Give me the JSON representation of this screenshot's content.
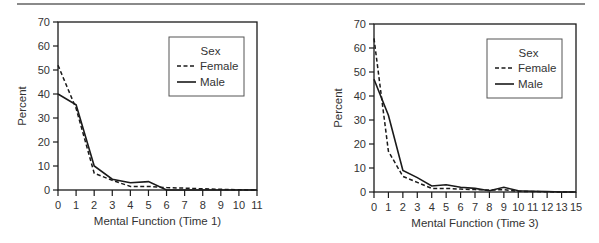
{
  "chart_data": [
    {
      "type": "line",
      "title": "",
      "xlabel": "Mental Function (Time 1)",
      "ylabel": "Percent",
      "ylim": [
        0,
        70
      ],
      "yticks": [
        0,
        10,
        20,
        30,
        40,
        50,
        60,
        70
      ],
      "categories": [
        "0",
        "1",
        "2",
        "3",
        "4",
        "5",
        "6",
        "7",
        "8",
        "9",
        "10",
        "11"
      ],
      "grid": false,
      "legend": {
        "title": "Sex",
        "position": "upper right",
        "entries": [
          "Female",
          "Male"
        ]
      },
      "series": [
        {
          "name": "Female",
          "style": "dashed",
          "values": [
            52,
            34,
            7,
            4,
            1.5,
            1.5,
            1,
            0.8,
            0.5,
            0.3,
            0.1,
            0
          ]
        },
        {
          "name": "Male",
          "style": "solid",
          "values": [
            40,
            35.5,
            10,
            4.5,
            3,
            3.5,
            0,
            0,
            0,
            0,
            0,
            0
          ]
        }
      ]
    },
    {
      "type": "line",
      "title": "",
      "xlabel": "Mental Function (Time 3)",
      "ylabel": "Percent",
      "ylim": [
        0,
        70
      ],
      "yticks": [
        0,
        10,
        20,
        30,
        40,
        50,
        60,
        70
      ],
      "categories": [
        "0",
        "1",
        "2",
        "3",
        "4",
        "5",
        "6",
        "7",
        "8",
        "9",
        "10",
        "11",
        "12",
        "13",
        "15"
      ],
      "grid": false,
      "legend": {
        "title": "Sex",
        "position": "upper right",
        "entries": [
          "Female",
          "Male"
        ]
      },
      "series": [
        {
          "name": "Female",
          "style": "dashed",
          "values": [
            64,
            17,
            6.5,
            4,
            1.5,
            1.5,
            1.2,
            1,
            0.8,
            1,
            0.3,
            0.2,
            0.1,
            0,
            0
          ]
        },
        {
          "name": "Male",
          "style": "solid",
          "values": [
            47,
            32,
            9,
            6,
            2.5,
            3,
            2,
            1.5,
            0.5,
            2,
            0.5,
            0.3,
            0.2,
            0,
            0
          ]
        }
      ]
    }
  ],
  "layout": [
    {
      "plot": {
        "x0": 58,
        "x1": 257,
        "y0": 190,
        "y1": 22
      },
      "legend_box": {
        "x": 169,
        "y": 37,
        "w": 75,
        "h": 59
      }
    },
    {
      "plot": {
        "x0": 374,
        "x1": 576,
        "y0": 192,
        "y1": 24
      },
      "legend_box": {
        "x": 487,
        "y": 39,
        "w": 75,
        "h": 59
      }
    }
  ],
  "colors": {
    "line": "#1a1a1a",
    "text": "#333333",
    "rule": "#8a8a8a"
  }
}
